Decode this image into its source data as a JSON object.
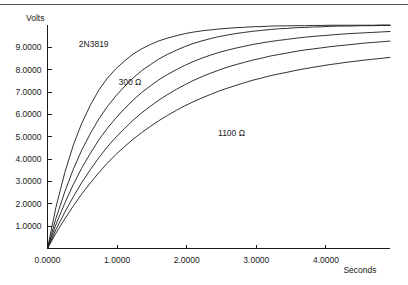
{
  "chart_data": {
    "type": "line",
    "title": "",
    "subtitle": "",
    "xlabel": "Seconds",
    "ylabel": "Volts",
    "xlim": [
      0.0,
      4.92
    ],
    "ylim": [
      0.0,
      10.0
    ],
    "grid": false,
    "legend_position": "inline-annotations",
    "x_ticks": [
      "0.0000",
      "1.0000",
      "2.0000",
      "3.0000",
      "4.0000"
    ],
    "x_tick_values": [
      0,
      1,
      2,
      3,
      4
    ],
    "y_ticks": [
      "1.0000",
      "2.0000",
      "3.0000",
      "4.0000",
      "5.0000",
      "6.0000",
      "7.0000",
      "8.0000",
      "9.0000"
    ],
    "y_tick_values": [
      1,
      2,
      3,
      4,
      5,
      6,
      7,
      8,
      9
    ],
    "annotations": [
      {
        "text": "2N3819",
        "x": 0.45,
        "y": 9.02
      },
      {
        "text": "300 Ω",
        "x": 1.02,
        "y": 7.3
      },
      {
        "text": "1100 Ω",
        "x": 2.45,
        "y": 5.05
      }
    ],
    "asymptote": 10.0,
    "series": [
      {
        "name": "300 Ω",
        "resistance_ohms": 300,
        "tau_seconds": 0.6,
        "x": [
          0.0,
          0.12,
          0.25,
          0.37,
          0.49,
          0.62,
          0.74,
          0.86,
          0.98,
          1.11,
          1.23,
          1.35,
          1.48,
          1.6,
          1.72,
          1.85,
          1.97,
          2.09,
          2.22,
          2.34,
          2.46,
          2.58,
          2.71,
          2.83,
          2.95,
          3.08,
          3.2,
          3.32,
          3.45,
          3.57,
          3.69,
          3.82,
          3.94,
          4.06,
          4.18,
          4.31,
          4.43,
          4.55,
          4.68,
          4.8,
          4.92
        ],
        "y": [
          0.0,
          1.83,
          3.41,
          4.62,
          5.59,
          6.44,
          7.1,
          7.62,
          8.04,
          8.4,
          8.7,
          8.93,
          9.13,
          9.29,
          9.41,
          9.52,
          9.61,
          9.68,
          9.74,
          9.78,
          9.82,
          9.85,
          9.88,
          9.9,
          9.92,
          9.93,
          9.95,
          9.96,
          9.96,
          9.97,
          9.97,
          9.98,
          9.98,
          9.99,
          9.99,
          9.99,
          9.99,
          9.99,
          9.99,
          10.0,
          10.0
        ]
      },
      {
        "name": "500 Ω",
        "resistance_ohms": 500,
        "tau_seconds": 0.85,
        "x": [
          0.0,
          0.12,
          0.25,
          0.37,
          0.49,
          0.62,
          0.74,
          0.86,
          0.98,
          1.11,
          1.23,
          1.35,
          1.48,
          1.6,
          1.72,
          1.85,
          1.97,
          2.09,
          2.22,
          2.34,
          2.46,
          2.58,
          2.71,
          2.83,
          2.95,
          3.08,
          3.2,
          3.32,
          3.45,
          3.57,
          3.69,
          3.82,
          3.94,
          4.06,
          4.18,
          4.31,
          4.43,
          4.55,
          4.68,
          4.8,
          4.92
        ],
        "y": [
          0.0,
          1.34,
          2.55,
          3.54,
          4.39,
          5.17,
          5.81,
          6.35,
          6.82,
          7.26,
          7.63,
          7.95,
          8.23,
          8.48,
          8.68,
          8.87,
          9.03,
          9.17,
          9.29,
          9.39,
          9.48,
          9.55,
          9.62,
          9.67,
          9.72,
          9.76,
          9.8,
          9.83,
          9.85,
          9.88,
          9.89,
          9.91,
          9.92,
          9.94,
          9.95,
          9.95,
          9.96,
          9.97,
          9.97,
          9.98,
          9.98
        ]
      },
      {
        "name": "700 Ω",
        "resistance_ohms": 700,
        "tau_seconds": 1.1,
        "x": [
          0.0,
          0.12,
          0.25,
          0.37,
          0.49,
          0.62,
          0.74,
          0.86,
          0.98,
          1.11,
          1.23,
          1.35,
          1.48,
          1.6,
          1.72,
          1.85,
          1.97,
          2.09,
          2.22,
          2.34,
          2.46,
          2.58,
          2.71,
          2.83,
          2.95,
          3.08,
          3.2,
          3.32,
          3.45,
          3.57,
          3.69,
          3.82,
          3.94,
          4.06,
          4.18,
          4.31,
          4.43,
          4.55,
          4.68,
          4.8,
          4.92
        ],
        "y": [
          0.0,
          1.06,
          2.04,
          2.86,
          3.59,
          4.28,
          4.87,
          5.38,
          5.83,
          6.27,
          6.64,
          6.97,
          7.28,
          7.55,
          7.78,
          8.0,
          8.19,
          8.36,
          8.52,
          8.65,
          8.77,
          8.87,
          8.97,
          9.05,
          9.13,
          9.2,
          9.26,
          9.31,
          9.36,
          9.41,
          9.45,
          9.49,
          9.52,
          9.55,
          9.58,
          9.61,
          9.63,
          9.65,
          9.67,
          9.69,
          9.71
        ]
      },
      {
        "name": "900 Ω",
        "resistance_ohms": 900,
        "tau_seconds": 1.4,
        "x": [
          0.0,
          0.12,
          0.25,
          0.37,
          0.49,
          0.62,
          0.74,
          0.86,
          0.98,
          1.11,
          1.23,
          1.35,
          1.48,
          1.6,
          1.72,
          1.85,
          1.97,
          2.09,
          2.22,
          2.34,
          2.46,
          2.58,
          2.71,
          2.83,
          2.95,
          3.08,
          3.2,
          3.32,
          3.45,
          3.57,
          3.69,
          3.82,
          3.94,
          4.06,
          4.18,
          4.31,
          4.43,
          4.55,
          4.68,
          4.8,
          4.92
        ],
        "y": [
          0.0,
          0.84,
          1.63,
          2.31,
          2.94,
          3.55,
          4.07,
          4.55,
          4.97,
          5.38,
          5.74,
          6.06,
          6.37,
          6.64,
          6.88,
          7.12,
          7.32,
          7.51,
          7.69,
          7.84,
          7.98,
          8.11,
          8.23,
          8.33,
          8.43,
          8.52,
          8.61,
          8.68,
          8.75,
          8.82,
          8.88,
          8.93,
          8.98,
          9.03,
          9.07,
          9.11,
          9.15,
          9.19,
          9.22,
          9.25,
          9.28
        ]
      },
      {
        "name": "1100 Ω",
        "resistance_ohms": 1100,
        "tau_seconds": 1.75,
        "x": [
          0.0,
          0.12,
          0.25,
          0.37,
          0.49,
          0.62,
          0.74,
          0.86,
          0.98,
          1.11,
          1.23,
          1.35,
          1.48,
          1.6,
          1.72,
          1.85,
          1.97,
          2.09,
          2.22,
          2.34,
          2.46,
          2.58,
          2.71,
          2.83,
          2.95,
          3.08,
          3.2,
          3.32,
          3.45,
          3.57,
          3.69,
          3.82,
          3.94,
          4.06,
          4.18,
          4.31,
          4.43,
          4.55,
          4.68,
          4.8,
          4.92
        ],
        "y": [
          0.0,
          0.68,
          1.33,
          1.9,
          2.43,
          2.95,
          3.4,
          3.82,
          4.2,
          4.57,
          4.89,
          5.18,
          5.47,
          5.72,
          5.95,
          6.18,
          6.38,
          6.56,
          6.74,
          6.89,
          7.04,
          7.17,
          7.3,
          7.42,
          7.53,
          7.63,
          7.73,
          7.81,
          7.89,
          7.97,
          8.04,
          8.11,
          8.17,
          8.23,
          8.28,
          8.34,
          8.38,
          8.43,
          8.47,
          8.51,
          8.55
        ]
      }
    ]
  }
}
